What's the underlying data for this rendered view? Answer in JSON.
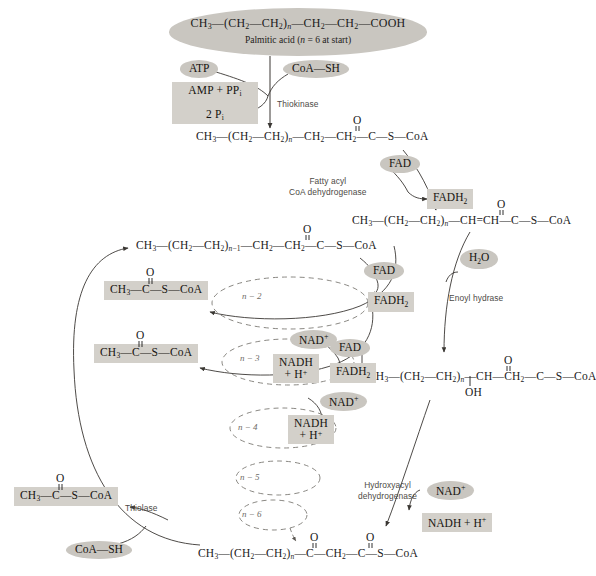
{
  "header": {
    "formula": "CH3—(CH2—CH2)n—CH2—CH2—COOH",
    "caption_prefix": "Palmitic acid (",
    "caption_italic": "n",
    "caption_suffix": " = 6 at start)"
  },
  "cofactors": {
    "atp": "ATP",
    "coa_sh_top": "CoA—SH",
    "coa_sh_bottom": "CoA—SH",
    "fad_1": "FAD",
    "fadh2_1": "FADH2",
    "h2o": "H2O",
    "nad_1": "NAD+",
    "nadh_1": "NADH + H+",
    "fad_2": "FAD",
    "fadh2_2": "FADH2",
    "nad_2": "NAD+",
    "nadh_2": "NADH + H+",
    "fad_3": "FAD",
    "fadh2_3": "FADH2",
    "nad_3": "NAD+",
    "nadh_3": "NADH + H+"
  },
  "boxes": {
    "amp_line1": "AMP + PPi",
    "amp_line2": "2 Pi",
    "acetyl_coa_1": "CH3—C(=O)—S—CoA",
    "acetyl_coa_2": "CH3—C(=O)—S—CoA",
    "acetyl_coa_3": "CH3—C(=O)—S—CoA"
  },
  "enzymes": {
    "thiokinase": "Thiokinase",
    "fatty_acyl_dehydrogenase_l1": "Fatty acyl",
    "fatty_acyl_dehydrogenase_l2": "CoA dehydrogenase",
    "enoyl_hydrase": "Enoyl hydrase",
    "hydroxyacyl_l1": "Hydroxyacyl",
    "hydroxyacyl_l2": "dehydrogenase",
    "thiolase": "Thiolase"
  },
  "intermediates": {
    "acyl_coa": "CH3—(CH2—CH2)n—CH2—CH2—C(=O)—S—CoA",
    "enoyl_coa": "CH3—(CH2—CH2)n—CH=CH—C(=O)—S—CoA",
    "hydroxyacyl_coa": "CH3—(CH2—CH2)n—CH(OH)—CH2—C(=O)—S—CoA",
    "ketoacyl_coa": "CH3—(CH2—CH2)n—C(=O)—CH2—C(=O)—S—CoA",
    "shortened_acyl_coa": "CH3—(CH2—CH2)n-1—CH2—CH2—C(=O)—S—CoA"
  },
  "spiral_labels": [
    "n − 2",
    "n − 3",
    "n − 4",
    "n − 5",
    "n − 6"
  ],
  "colors": {
    "pill_fill": "#c9c6c0",
    "box_fill": "#d3d0ca",
    "stroke": "#3a3733",
    "enzyme_text": "#4d4a46",
    "background": "#ffffff"
  }
}
